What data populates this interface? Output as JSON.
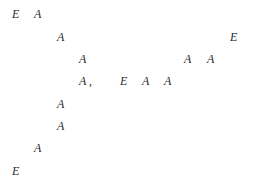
{
  "glyphs": [
    {
      "text": "E",
      "x": 12,
      "y": 8
    },
    {
      "text": "A",
      "x": 34,
      "y": 8
    },
    {
      "text": "A",
      "x": 57,
      "y": 31
    },
    {
      "text": "E",
      "x": 230,
      "y": 31
    },
    {
      "text": "A",
      "x": 79,
      "y": 53
    },
    {
      "text": "A",
      "x": 184,
      "y": 53
    },
    {
      "text": "A",
      "x": 207,
      "y": 53
    },
    {
      "text": "A ,",
      "x": 79,
      "y": 75
    },
    {
      "text": "E",
      "x": 120,
      "y": 75
    },
    {
      "text": "A",
      "x": 142,
      "y": 75
    },
    {
      "text": "A",
      "x": 164,
      "y": 75
    },
    {
      "text": "A",
      "x": 57,
      "y": 98
    },
    {
      "text": "A",
      "x": 57,
      "y": 120
    },
    {
      "text": "A",
      "x": 34,
      "y": 142
    },
    {
      "text": "E",
      "x": 12,
      "y": 165
    }
  ]
}
